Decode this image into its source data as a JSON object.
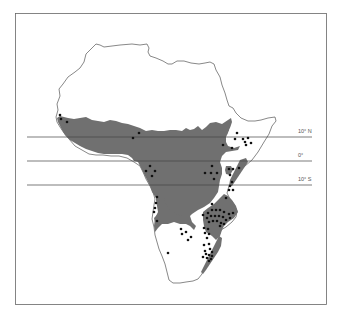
{
  "map": {
    "frame": {
      "x": 15,
      "y": 13,
      "width": 312,
      "height": 291,
      "stroke": "#666666"
    },
    "outline_color": "#555555",
    "range_fill_color": "#707070",
    "point_color": "#111111",
    "latitude_lines": [
      {
        "label": "10° N",
        "y": 137,
        "x1": 27,
        "x2": 312
      },
      {
        "label": "0°",
        "y": 161,
        "x1": 27,
        "x2": 312
      },
      {
        "label": "10° S",
        "y": 185,
        "x1": 27,
        "x2": 312
      }
    ],
    "labels": {
      "lat_10n": "10° N",
      "lat_0": "0°",
      "lat_10s": "10° S"
    }
  }
}
